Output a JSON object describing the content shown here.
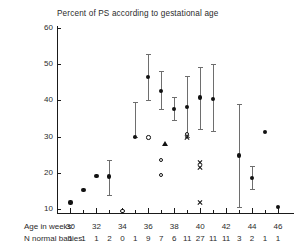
{
  "chart_data": {
    "type": "scatter",
    "title": "Percent of PS according to gestational age",
    "xlabel": "Age in weeks",
    "ylabel": "",
    "xlim": [
      29,
      47
    ],
    "ylim": [
      5,
      60
    ],
    "yticks": [
      10,
      20,
      30,
      40,
      50,
      60
    ],
    "xticks": [
      30,
      32,
      34,
      36,
      38,
      40,
      42,
      44,
      46
    ],
    "grid": false,
    "legend": "none",
    "row_labels": {
      "age": "Age in weeks:",
      "n": "N normal babies:"
    },
    "weeks": [
      30,
      31,
      32,
      33,
      34,
      35,
      36,
      37,
      38,
      39,
      40,
      41,
      42,
      43,
      44,
      45,
      46
    ],
    "n_normal_babies": [
      "1",
      "1",
      "1",
      "2",
      "0",
      "1",
      "9",
      "7",
      "6",
      "11",
      "27",
      "11",
      "11",
      "3",
      "2",
      "1",
      "1"
    ],
    "series": [
      {
        "name": "mean with 95% CI",
        "marker": "filled-circle",
        "points": [
          {
            "x": 30,
            "y": 11.8
          },
          {
            "x": 31,
            "y": 15.2
          },
          {
            "x": 32,
            "y": 19.2
          },
          {
            "x": 33,
            "y": 19.0,
            "lo": 14.0,
            "hi": 23.5
          },
          {
            "x": 35,
            "y": 30.0,
            "lo": 30.0,
            "hi": 39.5
          },
          {
            "x": 36,
            "y": 46.4,
            "lo": 40.2,
            "hi": 52.9
          },
          {
            "x": 37,
            "y": 42.5,
            "lo": 37.5,
            "hi": 48.0
          },
          {
            "x": 38,
            "y": 37.7,
            "lo": 34.6,
            "hi": 41.0
          },
          {
            "x": 39,
            "y": 38.2,
            "lo": 29.8,
            "hi": 46.8
          },
          {
            "x": 40,
            "y": 40.8,
            "lo": 32.0,
            "hi": 49.2
          },
          {
            "x": 41,
            "y": 40.3,
            "lo": 31.5,
            "hi": 50.0
          },
          {
            "x": 43,
            "y": 24.8,
            "lo": 10.6,
            "hi": 39.0
          },
          {
            "x": 44,
            "y": 18.6,
            "lo": 15.6,
            "hi": 21.8
          },
          {
            "x": 45,
            "y": 31.2
          },
          {
            "x": 46,
            "y": 10.6
          }
        ]
      },
      {
        "name": "open circle observations",
        "marker": "open-circle",
        "points": [
          {
            "x": 34,
            "y": 9.4
          },
          {
            "x": 36,
            "y": 29.8
          },
          {
            "x": 37,
            "y": 23.5
          },
          {
            "x": 37,
            "y": 19.4
          },
          {
            "x": 39,
            "y": 30.8
          }
        ]
      },
      {
        "name": "triangle observation",
        "marker": "triangle",
        "points": [
          {
            "x": 37.3,
            "y": 28.0
          }
        ]
      },
      {
        "name": "cross observations",
        "marker": "cross",
        "points": [
          {
            "x": 39,
            "y": 29.8
          },
          {
            "x": 40,
            "y": 22.9
          },
          {
            "x": 40,
            "y": 21.5
          },
          {
            "x": 40,
            "y": 11.8
          }
        ]
      }
    ]
  }
}
